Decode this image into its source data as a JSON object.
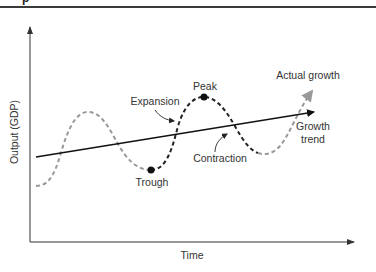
{
  "header": {
    "cut_off_text": "p"
  },
  "axes": {
    "x_label": "Time",
    "y_label": "Output (GDP)"
  },
  "labels": {
    "expansion": "Expansion",
    "peak": "Peak",
    "trough": "Trough",
    "contraction": "Contraction",
    "actual_growth": "Actual growth",
    "growth_trend_line1": "Growth",
    "growth_trend_line2": "trend"
  },
  "colors": {
    "axis": "#333333",
    "trend": "#111111",
    "actual_gray": "#999999",
    "cycle_black": "#222222",
    "text": "#333333"
  },
  "diagram": {
    "type": "business-cycle",
    "phases": [
      "Expansion",
      "Peak",
      "Contraction",
      "Trough"
    ],
    "series": [
      {
        "name": "Growth trend",
        "style": "solid",
        "shape": "straight upward-sloping arrow"
      },
      {
        "name": "Actual growth",
        "style": "dashed",
        "shape": "oscillating wave around trend, arrow at end"
      }
    ]
  }
}
